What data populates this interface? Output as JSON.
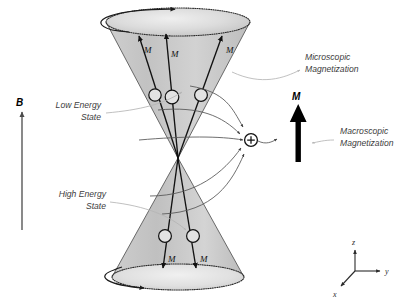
{
  "figure": {
    "background_color": "#ffffff",
    "cone_fill_color": "#c9c9c9",
    "cone_fill_light": "#dedede",
    "stroke_color": "#111111",
    "callout_color": "#b5b5b5"
  },
  "field_axis": {
    "label": "B",
    "direction": "up"
  },
  "state_labels": {
    "low_energy": {
      "line1": "Low Energy",
      "line2": "State"
    },
    "high_energy": {
      "line1": "High Energy",
      "line2": "State"
    }
  },
  "callouts": {
    "microscopic": {
      "line1": "Microscopic",
      "line2": "Magnetization"
    },
    "macroscopic": {
      "line1": "Macroscopic",
      "line2": "Magnetization"
    }
  },
  "macroscopic_vector": {
    "label": "M",
    "direction": "up"
  },
  "sum_node": {
    "symbol": "+",
    "name": "summation-node"
  },
  "upper_cone": {
    "name": "low-energy-cone",
    "spin_labels": [
      "M",
      "M",
      "M"
    ],
    "spin_count": 3
  },
  "lower_cone": {
    "name": "high-energy-cone",
    "spin_labels": [
      "M",
      "M"
    ],
    "spin_count": 2
  },
  "axes_triad": {
    "z": "z",
    "y": "y",
    "x": "x"
  }
}
